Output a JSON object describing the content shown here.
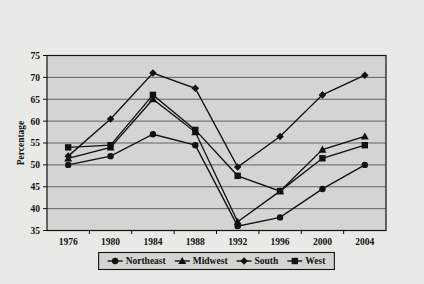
{
  "figure": {
    "title_line1": "Figure 5.2",
    "title_line2": "Republican Share of White Vote in Presidential",
    "title_line3": "Elections, 1976–2004"
  },
  "colors": {
    "page_background": "#e9e9e6",
    "plot_background": "#d4d4d1",
    "gridline": "#555555",
    "axis": "#111111",
    "series": "#111111",
    "text": "#111111"
  },
  "chart_data": {
    "type": "line",
    "title": "Republican Share of White Vote in Presidential Elections, 1976–2004",
    "xlabel": "",
    "ylabel": "Percentage",
    "categories": [
      "1976",
      "1980",
      "1984",
      "1988",
      "1992",
      "1996",
      "2000",
      "2004"
    ],
    "x": [
      1976,
      1980,
      1984,
      1988,
      1992,
      1996,
      2000,
      2004
    ],
    "ylim": [
      35,
      75
    ],
    "yticks": [
      35,
      40,
      45,
      50,
      55,
      60,
      65,
      70,
      75
    ],
    "grid": true,
    "legend_position": "bottom",
    "series": [
      {
        "name": "Northeast",
        "marker": "circle",
        "values": [
          50,
          52,
          57,
          54.5,
          36,
          38,
          44.5,
          50
        ]
      },
      {
        "name": "Midwest",
        "marker": "triangle",
        "values": [
          51.5,
          54,
          65,
          57.5,
          37,
          44,
          53.5,
          56.5
        ]
      },
      {
        "name": "South",
        "marker": "diamond",
        "values": [
          52,
          60.5,
          71,
          67.5,
          49.5,
          56.5,
          66,
          70.5
        ]
      },
      {
        "name": "West",
        "marker": "square",
        "values": [
          54,
          54.5,
          66,
          58,
          47.5,
          44,
          51.5,
          54.5
        ]
      }
    ]
  },
  "legend": {
    "items": [
      {
        "label": "Northeast",
        "marker": "circle"
      },
      {
        "label": "Midwest",
        "marker": "triangle"
      },
      {
        "label": "South",
        "marker": "diamond"
      },
      {
        "label": "West",
        "marker": "square"
      }
    ]
  }
}
